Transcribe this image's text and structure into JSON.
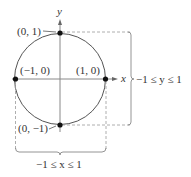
{
  "diagram": {
    "type": "unit-circle",
    "axes": {
      "x_label": "x",
      "y_label": "y"
    },
    "points": [
      {
        "label": "(0, 1)",
        "x": 0,
        "y": 1
      },
      {
        "label": "(−1, 0)",
        "x": -1,
        "y": 0
      },
      {
        "label": "(1, 0)",
        "x": 1,
        "y": 0
      },
      {
        "label": "(0, −1)",
        "x": 0,
        "y": -1
      }
    ],
    "range_labels": {
      "y_range": "−1 ≤ y ≤ 1",
      "x_range": "−1 ≤ x ≤ 1"
    },
    "colors": {
      "line": "#555555",
      "axis": "#888888",
      "dashed": "#999999",
      "point": "#111111"
    }
  }
}
